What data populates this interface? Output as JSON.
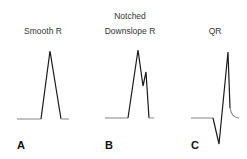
{
  "panels": [
    {
      "letter": "A",
      "title_line1": "",
      "title_line2": "Smooth R"
    },
    {
      "letter": "B",
      "title_line1": "Notched",
      "title_line2": "Downslope R"
    },
    {
      "letter": "C",
      "title_line1": "",
      "title_line2": "QR"
    }
  ],
  "colors": {
    "trace": "#1a1a1a",
    "baseline": "#888888"
  }
}
